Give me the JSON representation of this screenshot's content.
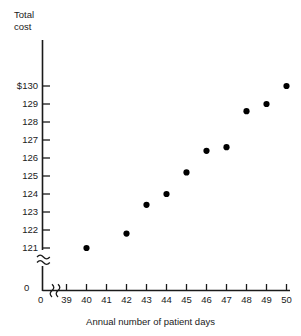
{
  "chart_data": {
    "type": "scatter",
    "title": "",
    "xlabel": "Annual number of patient days",
    "ylabel": "Total cost",
    "ylabel_lines": "Total\ncost",
    "x": [
      40,
      42,
      43,
      44,
      45,
      46,
      47,
      48,
      49,
      50
    ],
    "y": [
      121,
      121.8,
      123.4,
      124,
      125.2,
      126.4,
      126.6,
      128.6,
      129,
      130
    ],
    "points": [
      {
        "x": 40,
        "y": 121
      },
      {
        "x": 42,
        "y": 121.8
      },
      {
        "x": 43,
        "y": 123.4
      },
      {
        "x": 44,
        "y": 124
      },
      {
        "x": 45,
        "y": 125.2
      },
      {
        "x": 46,
        "y": 126.4
      },
      {
        "x": 47,
        "y": 126.6
      },
      {
        "x": 48,
        "y": 128.6
      },
      {
        "x": 49,
        "y": 129
      },
      {
        "x": 50,
        "y": 130
      }
    ],
    "xlim": [
      39,
      50
    ],
    "ylim": [
      121,
      130
    ],
    "xticks": [
      39,
      40,
      41,
      42,
      43,
      44,
      45,
      46,
      47,
      48,
      49,
      50
    ],
    "xtick_labels": [
      "39",
      "40",
      "41",
      "42",
      "43",
      "44",
      "45",
      "46",
      "47",
      "48",
      "49",
      "50"
    ],
    "yticks": [
      121,
      122,
      123,
      124,
      125,
      126,
      127,
      128,
      129,
      130
    ],
    "ytick_labels": [
      "121",
      "122",
      "123",
      "124",
      "125",
      "126",
      "127",
      "128",
      "129",
      "$130"
    ],
    "origin_label_y": "0",
    "origin_label_x": "0",
    "axis_break_y": true,
    "axis_break_x": true,
    "grid": false,
    "legend": false,
    "marker": "filled-circle",
    "marker_color": "#000000",
    "axis_color": "#1a1a1a"
  }
}
